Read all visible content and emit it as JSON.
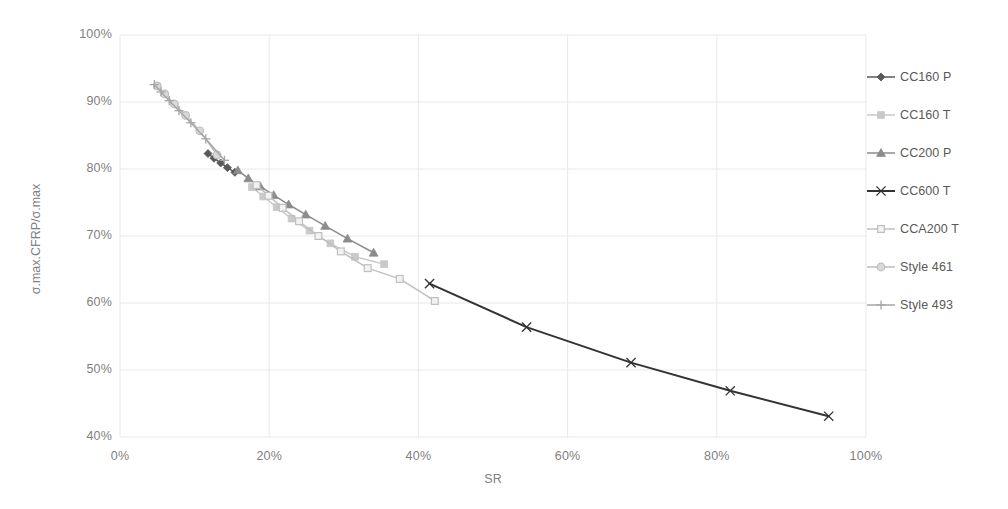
{
  "chart_data": {
    "type": "line",
    "title": "",
    "xlabel": "SR",
    "ylabel": "σ.max.CFRP/σ.max",
    "xlim": [
      0,
      100
    ],
    "ylim": [
      40,
      100
    ],
    "x_ticks": [
      "0%",
      "20%",
      "40%",
      "60%",
      "80%",
      "100%"
    ],
    "x_tick_values": [
      0,
      20,
      40,
      60,
      80,
      100
    ],
    "y_ticks": [
      "40%",
      "50%",
      "60%",
      "70%",
      "80%",
      "90%",
      "100%"
    ],
    "y_tick_values": [
      40,
      50,
      60,
      70,
      80,
      90,
      100
    ],
    "grid": true,
    "legend_position": "right",
    "series": [
      {
        "name": "CC160 P",
        "marker": "diamond",
        "color": "#595959",
        "x": [
          11.8,
          12.6,
          13.5,
          14.4,
          15.4
        ],
        "y": [
          82.3,
          81.6,
          80.9,
          80.2,
          79.5
        ]
      },
      {
        "name": "CC160 T",
        "marker": "square",
        "color": "#c9c9c9",
        "x": [
          17.7,
          19.2,
          21.0,
          23.0,
          25.4,
          28.2,
          31.5,
          35.4
        ],
        "y": [
          77.3,
          75.9,
          74.3,
          72.6,
          70.8,
          68.9,
          66.9,
          65.8
        ]
      },
      {
        "name": "CC200 P",
        "marker": "triangle",
        "color": "#8c8c8c",
        "x": [
          15.8,
          17.2,
          18.8,
          20.6,
          22.6,
          24.9,
          27.5,
          30.5,
          34.0
        ],
        "y": [
          79.8,
          78.6,
          77.4,
          76.1,
          74.7,
          73.2,
          71.5,
          69.6,
          67.5
        ]
      },
      {
        "name": "CC600 T",
        "marker": "x",
        "color": "#333333",
        "x": [
          41.5,
          54.5,
          68.5,
          81.8,
          95.0
        ],
        "y": [
          62.9,
          56.4,
          51.1,
          46.9,
          43.1
        ]
      },
      {
        "name": "CCA200 T",
        "marker": "square-open",
        "color": "#bfbfbf",
        "x": [
          18.3,
          19.9,
          21.8,
          24.0,
          26.6,
          29.6,
          33.2,
          37.5,
          42.2
        ],
        "y": [
          77.6,
          76.0,
          74.2,
          72.2,
          70.0,
          67.7,
          65.2,
          63.6,
          60.3
        ]
      },
      {
        "name": "Style 461",
        "marker": "circle",
        "color": "#bdbdbd",
        "x": [
          5.0,
          6.0,
          7.3,
          8.8,
          10.7,
          13.0
        ],
        "y": [
          92.4,
          91.2,
          89.7,
          88.0,
          85.7,
          82.1
        ]
      },
      {
        "name": "Style 493",
        "marker": "plus",
        "color": "#a6a6a6",
        "x": [
          4.6,
          5.5,
          6.6,
          7.9,
          9.5,
          11.5,
          14.0
        ],
        "y": [
          92.6,
          91.5,
          90.2,
          88.7,
          86.9,
          84.5,
          81.3
        ]
      }
    ]
  },
  "legend": {
    "items": [
      {
        "label": "CC160 P"
      },
      {
        "label": "CC160 T"
      },
      {
        "label": "CC200 P"
      },
      {
        "label": "CC600 T"
      },
      {
        "label": "CCA200 T"
      },
      {
        "label": "Style 461"
      },
      {
        "label": "Style 493"
      }
    ]
  },
  "colors": {
    "grid": "#e8e8e8",
    "text": "#808080",
    "legend_text": "#595959",
    "background": "#ffffff"
  }
}
